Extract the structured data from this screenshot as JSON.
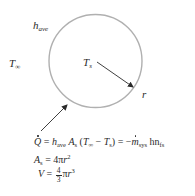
{
  "diagram": {
    "colors": {
      "circle": "#b0b0b0",
      "arrow": "#2a2a2a",
      "text": "#2a2a2a"
    },
    "labels": {
      "h_ave": {
        "main": "h",
        "sub": "ave"
      },
      "T_inf": {
        "main": "T",
        "sub": "∞"
      },
      "T_s": {
        "main": "T",
        "sub": "s"
      },
      "r": "r"
    },
    "equations": {
      "eq1": {
        "Q": "Q",
        "eq": " = ",
        "h": "h",
        "h_sub": "ave",
        "A": "A",
        "A_sub": "s",
        "paren_open": " (",
        "T1": "T",
        "T1_sub": "∞",
        "minus": " − ",
        "T2": "T",
        "T2_sub": "s",
        "paren_close_eq": ") = −",
        "m": "m",
        "m_sub": "sys",
        "hn": " hn",
        "hn_sub": "fs"
      },
      "eq2": {
        "A": "A",
        "A_sub": "s",
        "rhs": " = 4π",
        "r": "r",
        "exp": "2"
      },
      "eq3": {
        "V": "V",
        "eq": " = ",
        "num": "4",
        "den": "3",
        "pi": "π",
        "r": "r",
        "exp": "3"
      }
    }
  }
}
